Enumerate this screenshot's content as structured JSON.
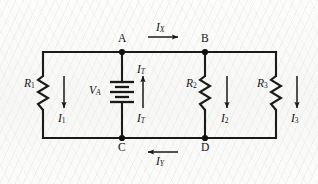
{
  "figure": {
    "kind": "electrical-schematic",
    "background_color": "#fbfbfa",
    "wire_color": "#1a1a1a"
  },
  "nodes": [
    {
      "id": "A",
      "label": "A",
      "x": 122,
      "y": 52
    },
    {
      "id": "B",
      "label": "B",
      "x": 205,
      "y": 52
    },
    {
      "id": "C",
      "label": "C",
      "x": 122,
      "y": 138
    },
    {
      "id": "D",
      "label": "D",
      "x": 205,
      "y": 138
    }
  ],
  "components": [
    {
      "id": "R1",
      "type": "resistor",
      "label": "R",
      "subscript": "1",
      "branch": "left-rail",
      "current_label": "I",
      "current_subscript": "1",
      "current_direction": "down"
    },
    {
      "id": "VA",
      "type": "battery",
      "label": "V",
      "subscript": "A",
      "branch": "A-C",
      "current_label": "I",
      "current_subscript": "T",
      "current_direction": "up"
    },
    {
      "id": "R2",
      "type": "resistor",
      "label": "R",
      "subscript": "2",
      "branch": "B-D",
      "current_label": "I",
      "current_subscript": "2",
      "current_direction": "down"
    },
    {
      "id": "R3",
      "type": "resistor",
      "label": "R",
      "subscript": "3",
      "branch": "right-rail",
      "current_label": "I",
      "current_subscript": "3",
      "current_direction": "down"
    }
  ],
  "currents": {
    "ix": {
      "label": "I",
      "subscript": "X",
      "direction": "right",
      "location": "top-rail-A-to-B"
    },
    "iy": {
      "label": "I",
      "subscript": "Y",
      "direction": "left",
      "location": "bottom-rail-D-to-C"
    },
    "i1": {
      "label": "I",
      "subscript": "1",
      "direction": "down"
    },
    "i2": {
      "label": "I",
      "subscript": "2",
      "direction": "down"
    },
    "i3": {
      "label": "I",
      "subscript": "3",
      "direction": "down"
    },
    "it_top": {
      "label": "I",
      "subscript": "T",
      "direction": "up"
    },
    "it_bottom": {
      "label": "I",
      "subscript": "T",
      "direction": "up"
    }
  },
  "labels": {
    "node_a": "A",
    "node_b": "B",
    "node_c": "C",
    "node_d": "D",
    "r1": "R",
    "r1_sub": "1",
    "r2": "R",
    "r2_sub": "2",
    "r3": "R",
    "r3_sub": "3",
    "va": "V",
    "va_sub": "A",
    "i1": "I",
    "i1_sub": "1",
    "i2": "I",
    "i2_sub": "2",
    "i3": "I",
    "i3_sub": "3",
    "ix": "I",
    "ix_sub": "X",
    "iy": "I",
    "iy_sub": "Y",
    "it_top": "I",
    "it_top_sub": "T",
    "it_bottom": "I",
    "it_bottom_sub": "T"
  }
}
